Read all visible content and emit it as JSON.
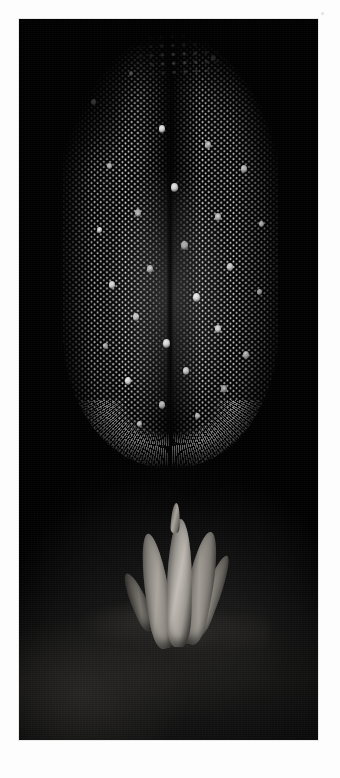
{
  "page": {
    "background_color": "#fdfdfd",
    "margin_speck_color": "#cccccc"
  },
  "plate": {
    "label": "scanning-electron-micrograph",
    "background_color": "#000000",
    "left": 19,
    "top": 19,
    "width": 299,
    "height": 721,
    "border_color": "#e8e8e8"
  },
  "subject": {
    "primary": "insect compound eye",
    "secondary": "tarsal claw appendage",
    "imaging_mode": "greyscale",
    "highlight_color": "#f2f2f2",
    "midtone_color": "#9a9690",
    "shadow_color": "#1b1b1b"
  },
  "eye": {
    "name": "compound-eye",
    "shape": "elongated dome, rounded ventral rim, feathered dorsal margin",
    "facet_pattern": "hexagonal close packing",
    "facet_pitch_px": 6.2,
    "seam": "median vertical groove",
    "rim": "radiating facet fringe",
    "bristles": [
      {
        "x": 28,
        "y": 86,
        "size": 5
      },
      {
        "x": 66,
        "y": 58,
        "size": 4
      },
      {
        "x": 148,
        "y": 42,
        "size": 5
      },
      {
        "x": 188,
        "y": 70,
        "size": 4
      },
      {
        "x": 96,
        "y": 112,
        "size": 6
      },
      {
        "x": 142,
        "y": 128,
        "size": 6
      },
      {
        "x": 44,
        "y": 150,
        "size": 5
      },
      {
        "x": 178,
        "y": 152,
        "size": 6
      },
      {
        "x": 108,
        "y": 170,
        "size": 7
      },
      {
        "x": 72,
        "y": 196,
        "size": 6
      },
      {
        "x": 152,
        "y": 200,
        "size": 6
      },
      {
        "x": 196,
        "y": 208,
        "size": 5
      },
      {
        "x": 34,
        "y": 214,
        "size": 5
      },
      {
        "x": 118,
        "y": 228,
        "size": 7
      },
      {
        "x": 84,
        "y": 252,
        "size": 6
      },
      {
        "x": 164,
        "y": 250,
        "size": 6
      },
      {
        "x": 46,
        "y": 268,
        "size": 6
      },
      {
        "x": 130,
        "y": 280,
        "size": 7
      },
      {
        "x": 194,
        "y": 276,
        "size": 5
      },
      {
        "x": 70,
        "y": 300,
        "size": 6
      },
      {
        "x": 152,
        "y": 312,
        "size": 6
      },
      {
        "x": 100,
        "y": 326,
        "size": 7
      },
      {
        "x": 40,
        "y": 330,
        "size": 5
      },
      {
        "x": 180,
        "y": 338,
        "size": 6
      },
      {
        "x": 120,
        "y": 354,
        "size": 6
      },
      {
        "x": 62,
        "y": 364,
        "size": 6
      },
      {
        "x": 158,
        "y": 372,
        "size": 6
      },
      {
        "x": 96,
        "y": 388,
        "size": 6
      },
      {
        "x": 132,
        "y": 400,
        "size": 5
      },
      {
        "x": 74,
        "y": 408,
        "size": 5
      }
    ]
  },
  "claw": {
    "name": "tarsal-claw",
    "digit_count": 5,
    "digits": [
      "claw-digit-far-left",
      "claw-digit-left",
      "claw-digit-center",
      "claw-digit-right",
      "claw-digit-far-right"
    ],
    "tip": "apical claw tip",
    "surface": "cuticle shelf"
  }
}
